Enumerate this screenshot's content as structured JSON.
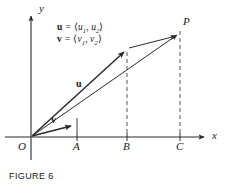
{
  "figure": {
    "caption": "FIGURE 6",
    "axes": {
      "x_label": "x",
      "y_label": "y"
    },
    "points": {
      "origin": "O",
      "a": "A",
      "b": "B",
      "c": "C",
      "p": "P"
    },
    "vector_labels": {
      "u": "u",
      "v": "v"
    },
    "definitions": {
      "u_line": {
        "name": "u",
        "equals": "=",
        "open": "⟨",
        "comp1": "u",
        "sub1": "1",
        "comma": ", ",
        "comp2": "u",
        "sub2": "2",
        "close": "⟩"
      },
      "v_line": {
        "name": "v",
        "equals": "=",
        "open": "⟨",
        "comp1": "v",
        "sub1": "1",
        "comma": ", ",
        "comp2": "v",
        "sub2": "2",
        "close": "⟩"
      }
    },
    "colors": {
      "ink": "#1a1a1a",
      "line": "#2b2b2b",
      "dash": "#555555",
      "background": "#ffffff"
    }
  }
}
